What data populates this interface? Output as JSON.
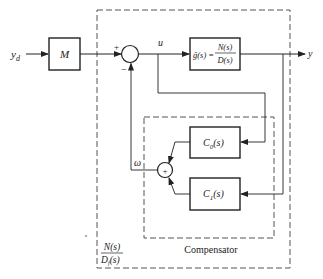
{
  "diagram": {
    "type": "block-diagram",
    "colors": {
      "line": "#222222",
      "dashed": "#555555",
      "background": "#ffffff"
    },
    "input": {
      "label": "y_d",
      "symbol": "y",
      "subscript": "d"
    },
    "output": {
      "label": "y"
    },
    "blocks": {
      "M": {
        "label": "M"
      },
      "plant": {
        "lhs": "ĝ(s) =",
        "numerator": "N(s)",
        "denominator": "D(s)"
      },
      "C0": {
        "label": "C",
        "subscript": "0",
        "arg": "(s)"
      },
      "C1": {
        "label": "C",
        "subscript": "1",
        "arg": "(s)"
      }
    },
    "summing_junctions": {
      "main": {
        "plus_sign": "+",
        "minus_sign": "−"
      },
      "compensator": {
        "sign": "+"
      }
    },
    "signals": {
      "u": "u",
      "omega": "ω"
    },
    "groups": {
      "compensator": {
        "label": "Compensator"
      },
      "closed_loop": {
        "numerator": "N(s)",
        "denominator": "D",
        "den_subscript": "f",
        "den_arg": "(s)"
      }
    }
  }
}
